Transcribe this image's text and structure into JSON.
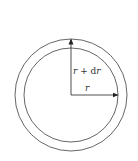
{
  "diagram": {
    "type": "concentric-circles",
    "colors": {
      "stroke": "#555555",
      "arrow": "#222222",
      "text": "#333333",
      "background": "#ffffff"
    },
    "center": {
      "x": 71,
      "y": 95
    },
    "outer_circle": {
      "radius": 56
    },
    "inner_circle": {
      "radius": 47
    },
    "labels": {
      "outer_radius": "r + dr",
      "outer_radius_parts": {
        "var": "r",
        "op": " + ",
        "d": "d",
        "var2": "r"
      },
      "inner_radius": "r"
    },
    "arrows": [
      {
        "name": "outer-radius-arrow",
        "direction": "up",
        "to_label": "r + dr"
      },
      {
        "name": "inner-radius-arrow",
        "direction": "right",
        "to_label": "r"
      }
    ]
  }
}
